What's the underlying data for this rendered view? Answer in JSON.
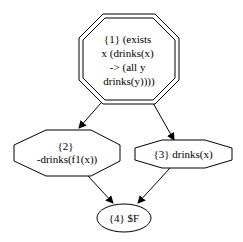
{
  "diagram": {
    "type": "proof-graph",
    "colors": {
      "stroke": "#000000",
      "fill": "#ffffff",
      "text": "#000000"
    },
    "nodes": [
      {
        "id": "1",
        "shape": "doubleoctagon",
        "lines": [
          "{1} (exists",
          "x (drinks(x)",
          "-> (all y",
          "drinks(y))))"
        ]
      },
      {
        "id": "2",
        "shape": "octagon",
        "lines": [
          "{2}",
          "-drinks(f1(x))"
        ]
      },
      {
        "id": "3",
        "shape": "octagon",
        "lines": [
          "{3} drinks(x)"
        ]
      },
      {
        "id": "4",
        "shape": "ellipse",
        "lines": [
          "{4} $F"
        ]
      }
    ],
    "edges": [
      {
        "from": "1",
        "to": "2"
      },
      {
        "from": "1",
        "to": "3"
      },
      {
        "from": "2",
        "to": "4"
      },
      {
        "from": "3",
        "to": "4"
      }
    ]
  }
}
